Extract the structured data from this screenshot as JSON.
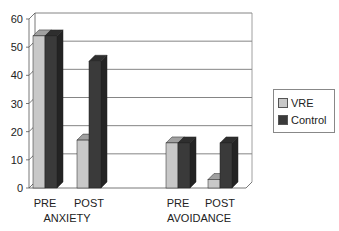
{
  "chart_data": {
    "type": "bar",
    "title": "",
    "xlabel": "",
    "ylabel": "",
    "ylim": [
      0,
      60
    ],
    "yticks": [
      0,
      10,
      20,
      30,
      40,
      50,
      60
    ],
    "grid": true,
    "style": "3d-clustered-column",
    "groups": [
      {
        "label": "ANXIETY",
        "categories": [
          "PRE",
          "POST"
        ]
      },
      {
        "label": "AVOIDANCE",
        "categories": [
          "PRE",
          "POST"
        ]
      }
    ],
    "categories": [
      "ANXIETY PRE",
      "ANXIETY POST",
      "AVOIDANCE PRE",
      "AVOIDANCE POST"
    ],
    "series": [
      {
        "name": "VRE",
        "color": "#c8c8c8",
        "values": [
          54,
          17,
          16,
          3
        ]
      },
      {
        "name": "Control",
        "color": "#3a3a3a",
        "values": [
          54,
          45,
          16,
          16
        ]
      }
    ],
    "legend_position": "right"
  }
}
